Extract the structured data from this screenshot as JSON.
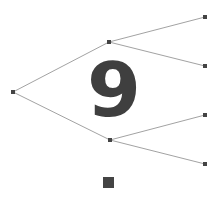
{
  "diagram": {
    "type": "binary-tree",
    "center_label": "9",
    "colors": {
      "edge": "#8a8a8a",
      "node": "#444444",
      "label": "#3f3f3f",
      "background": "#ffffff"
    },
    "nodes": [
      {
        "id": "root",
        "x": 13,
        "y": 92
      },
      {
        "id": "mid-top",
        "x": 109,
        "y": 42
      },
      {
        "id": "mid-bottom",
        "x": 110,
        "y": 140
      },
      {
        "id": "leaf-1",
        "x": 205,
        "y": 17
      },
      {
        "id": "leaf-2",
        "x": 205,
        "y": 66
      },
      {
        "id": "leaf-3",
        "x": 205,
        "y": 115
      },
      {
        "id": "leaf-4",
        "x": 205,
        "y": 164
      }
    ],
    "edges": [
      [
        "root",
        "mid-top"
      ],
      [
        "root",
        "mid-bottom"
      ],
      [
        "mid-top",
        "leaf-1"
      ],
      [
        "mid-top",
        "leaf-2"
      ],
      [
        "mid-bottom",
        "leaf-3"
      ],
      [
        "mid-bottom",
        "leaf-4"
      ]
    ],
    "extra_marker": {
      "shape": "square",
      "x": 103,
      "y": 177,
      "size": 11
    }
  }
}
